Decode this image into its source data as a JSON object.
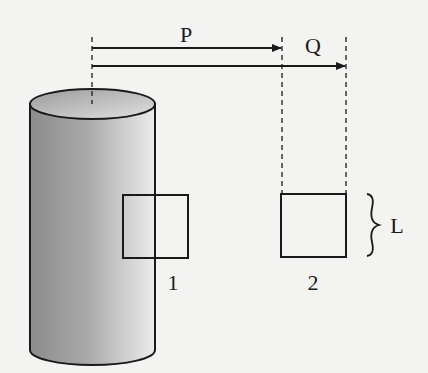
{
  "diagram": {
    "labels": {
      "arrow_p": "P",
      "arrow_q": "Q",
      "square_1": "1",
      "square_2": "2",
      "side_length": "L"
    },
    "colors": {
      "background": "#f3f3f1",
      "stroke": "#1a1a1a",
      "cylinder_light": "#e6e6e6",
      "cylinder_dark": "#8a8a8a"
    },
    "elements": [
      {
        "name": "cylinder",
        "description": "shaded vertical cylinder with dashed axis"
      },
      {
        "name": "arrow-p",
        "description": "horizontal arrow from axis to first dashed line",
        "label": "P"
      },
      {
        "name": "arrow-q",
        "description": "horizontal arrow from axis to second dashed line",
        "label": "Q"
      },
      {
        "name": "square-1",
        "description": "square straddling cylinder surface",
        "label": "1"
      },
      {
        "name": "square-2",
        "description": "square at distance away from cylinder",
        "label": "2"
      },
      {
        "name": "brace",
        "description": "curly brace marking square side length",
        "label": "L"
      }
    ]
  }
}
